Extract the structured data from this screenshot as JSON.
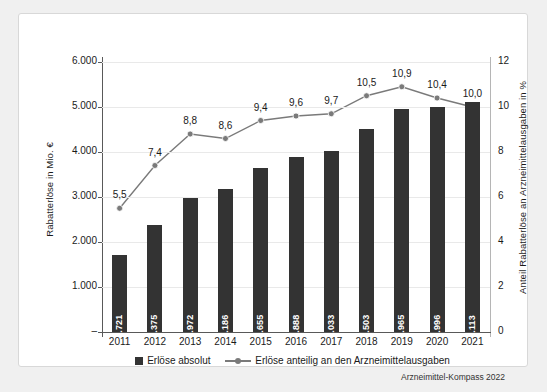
{
  "card": {
    "source_note": "Arzneimittel-Kompass 2022"
  },
  "legend": {
    "items": [
      {
        "label": "Erlöse absolut",
        "marker": "bar-swatch",
        "color": "#333333"
      },
      {
        "label": "Erlöse anteilig an den Arzneimittelausgaben",
        "marker": "line-swatch",
        "color": "#7a7a7a"
      }
    ]
  },
  "chart_data": {
    "type": "bar",
    "title": "",
    "subtitle": "",
    "xlabel": "",
    "ylabel": "Rabatterlöse in Mio. €",
    "y2label": "Anteil Rabatterlöse an Arzneimittelausgaben in %",
    "categories": [
      "2011",
      "2012",
      "2013",
      "2014",
      "2015",
      "2016",
      "2017",
      "2018",
      "2019",
      "2020",
      "2021"
    ],
    "ylim": [
      0,
      6000
    ],
    "y2lim": [
      0,
      12
    ],
    "yticks": [
      0,
      1000,
      2000,
      3000,
      4000,
      5000,
      6000
    ],
    "ytick_labels": [
      "–",
      "1.000",
      "2.000",
      "3.000",
      "4.000",
      "5.000",
      "6.000"
    ],
    "y2ticks": [
      0,
      2,
      4,
      6,
      8,
      10,
      12
    ],
    "y2tick_labels": [
      "0",
      "2",
      "4",
      "6",
      "8",
      "10",
      "12"
    ],
    "grid": true,
    "legend_position": "bottom",
    "series": [
      {
        "name": "Erlöse absolut",
        "type": "bar",
        "axis": "left",
        "color": "#333333",
        "values": [
          1721,
          2375,
          2972,
          3186,
          3655,
          3888,
          4033,
          4503,
          4965,
          4996,
          5113
        ],
        "labels": [
          "1.721",
          "2.375",
          "2.972",
          "3.186",
          "3.655",
          "3.888",
          "4.033",
          "4.503",
          "4.965",
          "4.996",
          "5.113"
        ]
      },
      {
        "name": "Erlöse anteilig an den Arzneimittelausgaben",
        "type": "line",
        "axis": "right",
        "color": "#7a7a7a",
        "values": [
          5.5,
          7.4,
          8.8,
          8.6,
          9.4,
          9.6,
          9.7,
          10.5,
          10.9,
          10.4,
          10.0
        ],
        "labels": [
          "5,5",
          "7,4",
          "8,8",
          "8,6",
          "9,4",
          "9,6",
          "9,7",
          "10,5",
          "10,9",
          "10,4",
          "10,0"
        ]
      }
    ]
  }
}
